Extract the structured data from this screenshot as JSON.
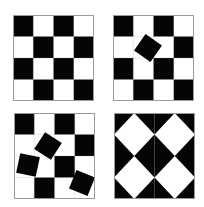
{
  "figure": {
    "colors": {
      "dark": "#050505",
      "light": "#ffffff",
      "border": "#9a9a9a"
    },
    "panels": [
      {
        "id": "checkerboard-plain",
        "position": "top-left",
        "grid": [
          [
            1,
            0,
            1,
            0
          ],
          [
            0,
            1,
            0,
            1
          ],
          [
            1,
            0,
            1,
            0
          ],
          [
            0,
            1,
            0,
            1
          ]
        ],
        "rotated_squares": []
      },
      {
        "id": "checkerboard-one-rotated",
        "position": "top-right",
        "grid": [
          [
            1,
            0,
            1,
            0
          ],
          [
            0,
            0,
            0,
            1
          ],
          [
            1,
            0,
            1,
            0
          ],
          [
            0,
            1,
            0,
            1
          ]
        ],
        "rotated_squares": [
          {
            "cx": 35,
            "cy": 33,
            "size": 20,
            "angle": 35
          }
        ]
      },
      {
        "id": "checkerboard-three-rotated",
        "position": "bottom-left",
        "grid": [
          [
            1,
            0,
            1,
            0
          ],
          [
            0,
            0,
            0,
            1
          ],
          [
            0,
            0,
            1,
            0
          ],
          [
            0,
            1,
            0,
            0
          ]
        ],
        "rotated_squares": [
          {
            "cx": 34,
            "cy": 33,
            "size": 20,
            "angle": 33
          },
          {
            "cx": 14,
            "cy": 52,
            "size": 20,
            "angle": 12
          },
          {
            "cx": 68,
            "cy": 70,
            "size": 20,
            "angle": 22
          }
        ]
      },
      {
        "id": "triangle-pinwheel",
        "position": "bottom-right",
        "triangle_grid": [
          [
            "tl",
            "tr",
            "tl",
            "tr"
          ],
          [
            "bl",
            "br",
            "bl",
            "br"
          ],
          [
            "tl",
            "tr",
            "tl",
            "tr"
          ],
          [
            "bl",
            "br",
            "bl",
            "br"
          ]
        ]
      }
    ]
  }
}
